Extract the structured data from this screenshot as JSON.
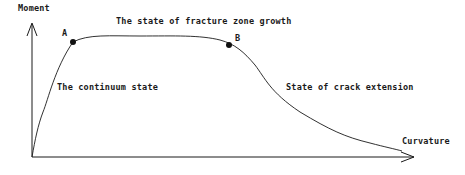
{
  "diagram": {
    "title": "",
    "axes": {
      "y_label": "Moment",
      "x_label": "Curvature"
    },
    "points": [
      {
        "id": "A",
        "label": "A"
      },
      {
        "id": "B",
        "label": "B"
      }
    ],
    "regions": {
      "continuum": "The continuum state",
      "fracture_zone": "The state of fracture zone growth",
      "crack_extension": "State of crack extension"
    },
    "colors": {
      "line": "#1a1a1a",
      "background": "#ffffff"
    }
  }
}
